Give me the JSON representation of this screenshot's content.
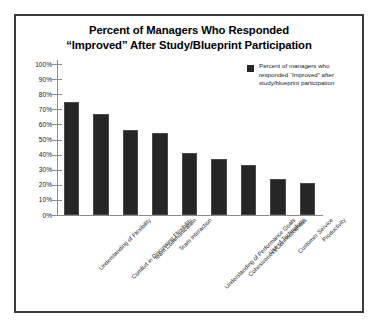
{
  "chart_data": {
    "type": "bar",
    "title": "Percent of Managers Who Responded “Improved” After Study/Blueprint Participation",
    "title_lines": [
      "Percent of Managers Who Responded",
      "“Improved” After Study/Blueprint Participation"
    ],
    "categories": [
      "Understanding of Flexibility",
      "Comfort in Discussing Flexibility",
      "Team Communication",
      "Team Interaction",
      "Understanding of Performance Goals",
      "Cohesiveness/Connectedness",
      "Use of Technology",
      "Customer Service",
      "Productivity"
    ],
    "values": [
      75,
      67,
      56,
      54,
      41,
      37,
      33,
      24,
      21
    ],
    "value_labels": [
      "75%",
      "67%",
      "56%",
      "54%",
      "41%",
      "37%",
      "33%",
      "24%",
      "21%"
    ],
    "series": [
      {
        "name": "Percent of managers who responded “Improved” after study/blueprint participation",
        "values": [
          75,
          67,
          56,
          54,
          41,
          37,
          33,
          24,
          21
        ],
        "color": "#262626"
      }
    ],
    "xlabel": "",
    "ylabel": "",
    "ylim": [
      0,
      100
    ],
    "y_ticks": [
      0,
      10,
      20,
      30,
      40,
      50,
      60,
      70,
      80,
      90,
      100
    ],
    "y_tick_labels": [
      "0%",
      "10%",
      "20%",
      "30%",
      "40%",
      "50%",
      "60%",
      "70%",
      "80%",
      "90%",
      "100%"
    ],
    "grid": false,
    "legend_position": "upper right"
  },
  "legend": {
    "entries": [
      {
        "label": "Percent of managers who responded “Improved” after study/blueprint participation",
        "color": "#262626"
      }
    ]
  },
  "colors": {
    "bar": "#262626",
    "axis": "#8c8c8c",
    "frame_border": "#3b3b3f",
    "background": "#ffffff",
    "text": "#000000"
  }
}
